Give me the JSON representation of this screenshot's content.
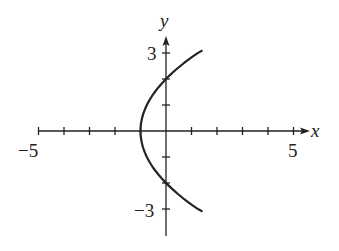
{
  "chart_data": {
    "type": "line",
    "title": "",
    "xlabel": "x",
    "ylabel": "y",
    "xlim": [
      -5,
      5
    ],
    "ylim": [
      -3,
      3
    ],
    "x_tick_labels": [
      "-5",
      "5"
    ],
    "y_tick_labels": [
      "3",
      "-3"
    ],
    "x_ticks": [
      -5,
      -4,
      -3,
      -2,
      -1,
      0,
      1,
      2,
      3,
      4,
      5
    ],
    "y_ticks": [
      -3,
      -2,
      -1,
      0,
      1,
      2,
      3
    ],
    "grid": false,
    "series": [
      {
        "name": "x = y^2/4 - 1",
        "description": "Sideways parabola opening right, vertex at (-1, 0), y-intercepts at (0, 2) and (0, -2)",
        "points": [
          {
            "x": 1.4,
            "y": -3.1
          },
          {
            "x": 0.56,
            "y": -2.5
          },
          {
            "x": 0,
            "y": -2
          },
          {
            "x": -0.44,
            "y": -1.5
          },
          {
            "x": -0.75,
            "y": -1
          },
          {
            "x": -0.94,
            "y": -0.5
          },
          {
            "x": -1,
            "y": 0
          },
          {
            "x": -0.94,
            "y": 0.5
          },
          {
            "x": -0.75,
            "y": 1
          },
          {
            "x": -0.44,
            "y": 1.5
          },
          {
            "x": 0,
            "y": 2
          },
          {
            "x": 0.56,
            "y": 2.5
          },
          {
            "x": 1.4,
            "y": 3.1
          }
        ]
      }
    ]
  },
  "labels": {
    "x_axis": "x",
    "y_axis": "y",
    "x_min": "−5",
    "x_max": "5",
    "y_max": "3",
    "y_min": "−3"
  },
  "colors": {
    "ink": "#222222",
    "background": "#ffffff"
  }
}
